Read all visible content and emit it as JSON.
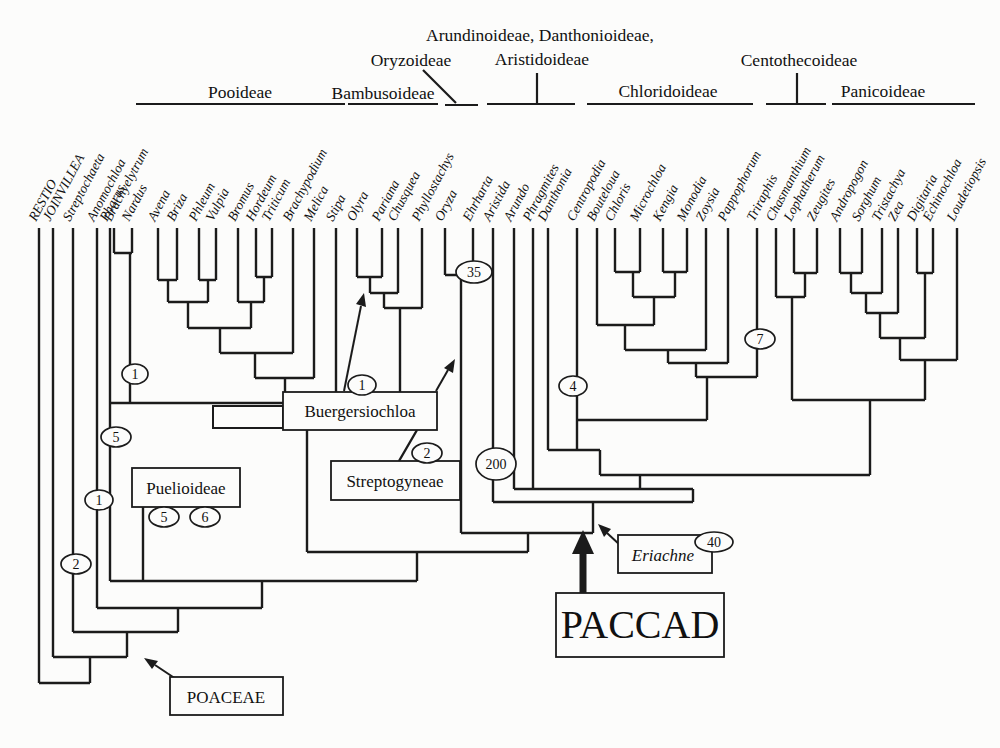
{
  "title_labels": {
    "arundinoideae_danthonioideae": "Arundinoideae, Danthonioideae,",
    "oryzoideae": "Oryzoideae",
    "aristidoideae": "Aristidoideae",
    "centothecoideae": "Centothecoideae",
    "pooideae": "Pooideae",
    "bambusoideae": "Bambusoideae",
    "chloridoideae": "Chloridoideae",
    "panicoideae": "Panicoideae"
  },
  "taxa": [
    "RESTIO",
    "JOINVILLEA",
    "Streptochaeta",
    "Anomochloa",
    "Pharus",
    "Brachyelytrum",
    "Nardus",
    "Avena",
    "Briza",
    "Phleum",
    "Vulpia",
    "Bromus",
    "Hordeum",
    "Triticum",
    "Brachypodium",
    "Melica",
    "Stipa",
    "Olyra",
    "Pariana",
    "Chusquea",
    "Phyllostachys",
    "Oryza",
    "Ehrharta",
    "Aristida",
    "Arundo",
    "Phragmites",
    "Danthonia",
    "Centropodia",
    "Bouteloua",
    "Chloris",
    "Microchloa",
    "Kengia",
    "Monodia",
    "Zoysia",
    "Pappophorum",
    "Triraphis",
    "Chasmanthium",
    "Lophatherum",
    "Zeugites",
    "Andropogon",
    "Sorghum",
    "Tristachya",
    "Zea",
    "Digitaria",
    "Echinochloa",
    "Loudetiopsis"
  ],
  "boxes": {
    "buergersiochloa": "Buergersiochloa",
    "puelioideae": "Puelioideae",
    "streptogyneae": "Streptogyneae",
    "poaceae": "POACEAE",
    "eriachne": "Eriachne",
    "paccad": "PACCAD"
  },
  "node_counts": {
    "brachyelytrum_nardus": "1",
    "pharus": "5",
    "anomochloa": "1",
    "streptochaeta": "2",
    "puelioideae_left": "5",
    "puelioideae_right": "6",
    "buergersiochloa": "1",
    "streptogyneae": "2",
    "oryzoideae": "35",
    "aristida": "200",
    "centropodia": "4",
    "triraphis": "7",
    "eriachne": "40"
  },
  "colors": {
    "line": "#1b1b1b",
    "background": "#fcfcfb"
  }
}
